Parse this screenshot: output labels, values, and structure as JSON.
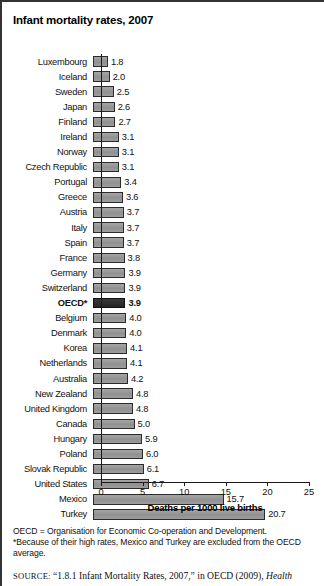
{
  "figure": {
    "title": "Infant mortality rates, 2007"
  },
  "chart_data": {
    "type": "bar",
    "orientation": "horizontal",
    "title": "Infant mortality rates, 2007",
    "xlabel": "Deaths per 1000 live births",
    "ylabel": "",
    "xlim": [
      0,
      25
    ],
    "xticks": [
      0,
      5,
      10,
      15,
      20,
      25
    ],
    "grid": false,
    "legend": "none",
    "highlight_category": "OECD*",
    "categories": [
      "Luxembourg",
      "Iceland",
      "Sweden",
      "Japan",
      "Finland",
      "Ireland",
      "Norway",
      "Czech Republic",
      "Portugal",
      "Greece",
      "Austria",
      "Italy",
      "Spain",
      "France",
      "Germany",
      "Switzerland",
      "OECD*",
      "Belgium",
      "Denmark",
      "Korea",
      "Netherlands",
      "Australia",
      "New Zealand",
      "United Kingdom",
      "Canada",
      "Hungary",
      "Poland",
      "Slovak Republic",
      "United States",
      "Mexico",
      "Turkey"
    ],
    "values": [
      1.8,
      2.0,
      2.5,
      2.6,
      2.7,
      3.1,
      3.1,
      3.1,
      3.4,
      3.6,
      3.7,
      3.7,
      3.7,
      3.8,
      3.9,
      3.9,
      3.9,
      4.0,
      4.0,
      4.1,
      4.1,
      4.2,
      4.8,
      4.8,
      5.0,
      5.9,
      6.0,
      6.1,
      6.7,
      15.7,
      20.7
    ],
    "value_labels": [
      "1.8",
      "2.0",
      "2.5",
      "2.6",
      "2.7",
      "3.1",
      "3.1",
      "3.1",
      "3.4",
      "3.6",
      "3.7",
      "3.7",
      "3.7",
      "3.8",
      "3.9",
      "3.9",
      "3.9",
      "4.0",
      "4.0",
      "4.1",
      "4.1",
      "4.2",
      "4.8",
      "4.8",
      "5.0",
      "5.9",
      "6.0",
      "6.1",
      "6.7",
      "15.7",
      "20.7"
    ],
    "tick_labels": [
      "0",
      "5",
      "10",
      "15",
      "20",
      "25"
    ],
    "colors": {
      "bar_fill": "#9a9a9a",
      "bar_stroke": "#2b2b2b",
      "highlight_fill": "#2e2e2e",
      "axis": "#1a1a1a",
      "text": "#111111"
    }
  },
  "notes": {
    "line1": "OECD = Organisation for Economic Co-operation and Development.",
    "line2": "*Because of their high rates, Mexico and Turkey are excluded from the OECD average."
  },
  "source": {
    "label": "SOURCE:",
    "text": "“1.8.1 Infant Mortality Rates, 2007,” in OECD (2009),",
    "italic_tail": "Health"
  }
}
